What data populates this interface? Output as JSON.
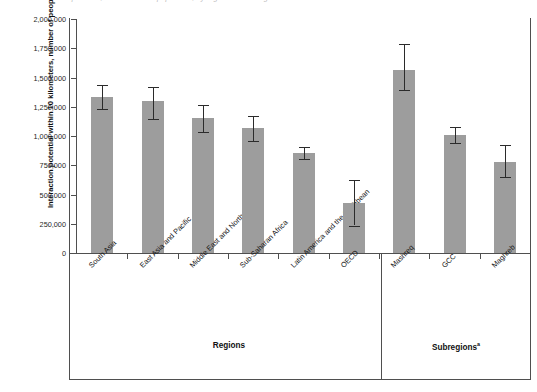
{
  "caption": {
    "text": "Interaction potential, urbanization of population, by region and subregion"
  },
  "chart_data": {
    "type": "bar",
    "title": "",
    "xlabel": "",
    "ylabel": "Interaction potential within 10 kilometers, number of people",
    "ylim": [
      0,
      2000000
    ],
    "ytick_labels": [
      "2,000,000",
      "1,750,000",
      "1,500,000",
      "1,250,000",
      "1,000,000",
      "750,000",
      "500,000",
      "250,000",
      "0"
    ],
    "ytick_values": [
      2000000,
      1750000,
      1500000,
      1250000,
      1000000,
      750000,
      500000,
      250000,
      0
    ],
    "grid": false,
    "legend": false,
    "bar_color": "#9d9d9d",
    "error_color": "#2b2b2b",
    "categories": [
      "South Asia",
      "East Asia and Pacific",
      "Middle East and North Africa",
      "Sub-Saharan Africa",
      "Latin America and the Caribbean",
      "OECD",
      "Mashreq",
      "GCC",
      "Maghreb"
    ],
    "values": [
      1333000,
      1300000,
      1150000,
      1065000,
      855000,
      427000,
      1565000,
      1010000,
      780000
    ],
    "error_low": [
      1230000,
      1145000,
      1030000,
      960000,
      805000,
      235000,
      1395000,
      940000,
      650000
    ],
    "error_high": [
      1435000,
      1420000,
      1265000,
      1170000,
      905000,
      620000,
      1790000,
      1080000,
      925000
    ],
    "groups": [
      {
        "label": "Regions",
        "superscript": "",
        "categories": [
          "South Asia",
          "East Asia and Pacific",
          "Middle East and North Africa",
          "Sub-Saharan Africa",
          "Latin America and the Caribbean",
          "OECD"
        ]
      },
      {
        "label": "Subregions",
        "superscript": "a",
        "categories": [
          "Mashreq",
          "GCC",
          "Maghreb"
        ]
      }
    ]
  },
  "axis": {
    "group_regions_label": "Regions",
    "group_subregions_label": "Subregions",
    "group_subregions_superscript": "a"
  }
}
